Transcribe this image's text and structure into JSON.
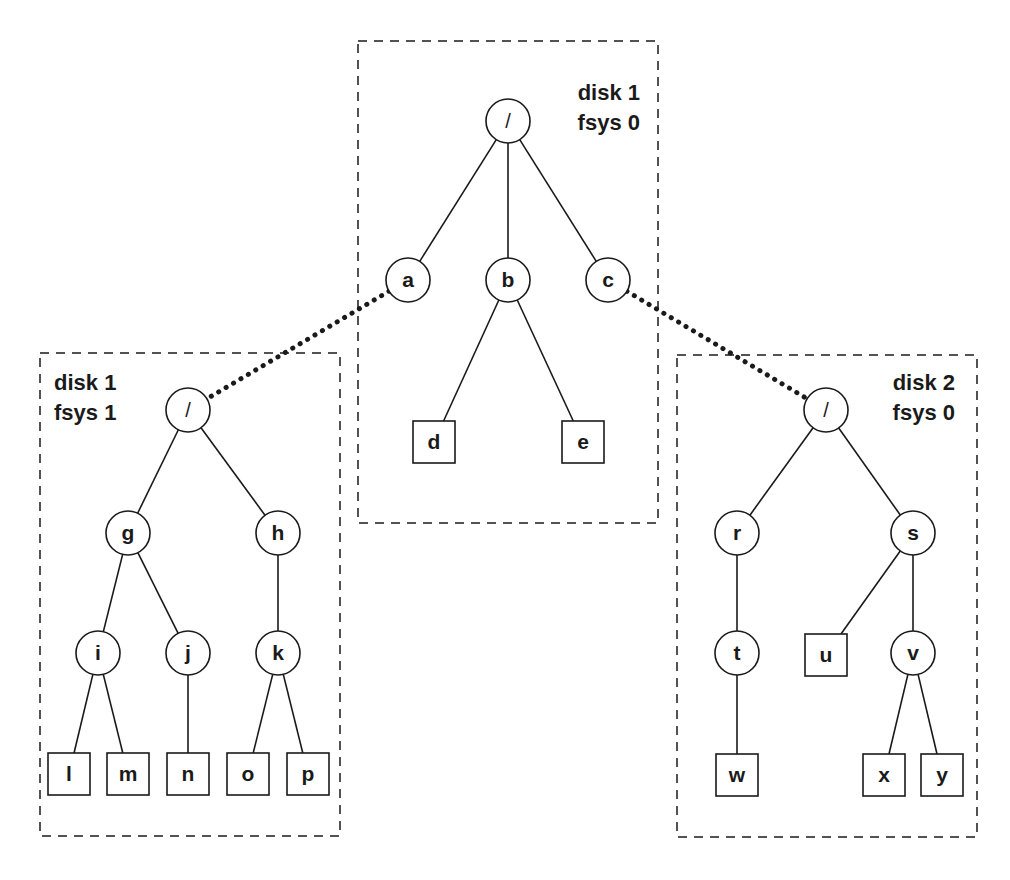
{
  "diagram": {
    "colors": {
      "stroke": "#1a1a1a",
      "background": "#ffffff"
    },
    "filesystems": [
      {
        "id": "center",
        "label_line1": "disk 1",
        "label_line2": "fsys 0",
        "box": {
          "x": 358,
          "y": 41,
          "w": 300,
          "h": 482
        },
        "label_x": 640,
        "label_y": 100,
        "anchor": "end"
      },
      {
        "id": "left",
        "label_line1": "disk 1",
        "label_line2": "fsys 1",
        "box": {
          "x": 40,
          "y": 353,
          "w": 300,
          "h": 483
        },
        "label_x": 54,
        "label_y": 390,
        "anchor": "start"
      },
      {
        "id": "right",
        "label_line1": "disk 2",
        "label_line2": "fsys 0",
        "box": {
          "x": 677,
          "y": 355,
          "w": 300,
          "h": 482
        },
        "label_x": 955,
        "label_y": 390,
        "anchor": "end"
      }
    ],
    "nodes": [
      {
        "id": "root0",
        "label": "/",
        "shape": "circle",
        "x": 508,
        "y": 121
      },
      {
        "id": "a",
        "label": "a",
        "shape": "circle",
        "x": 408,
        "y": 280
      },
      {
        "id": "b",
        "label": "b",
        "shape": "circle",
        "x": 508,
        "y": 280
      },
      {
        "id": "c",
        "label": "c",
        "shape": "circle",
        "x": 608,
        "y": 280
      },
      {
        "id": "d",
        "label": "d",
        "shape": "square",
        "x": 434,
        "y": 442
      },
      {
        "id": "e",
        "label": "e",
        "shape": "square",
        "x": 583,
        "y": 442
      },
      {
        "id": "root1",
        "label": "/",
        "shape": "circle",
        "x": 188,
        "y": 410
      },
      {
        "id": "g",
        "label": "g",
        "shape": "circle",
        "x": 128,
        "y": 533
      },
      {
        "id": "h",
        "label": "h",
        "shape": "circle",
        "x": 278,
        "y": 533
      },
      {
        "id": "i",
        "label": "i",
        "shape": "circle",
        "x": 98,
        "y": 653
      },
      {
        "id": "j",
        "label": "j",
        "shape": "circle",
        "x": 188,
        "y": 653
      },
      {
        "id": "k",
        "label": "k",
        "shape": "circle",
        "x": 278,
        "y": 653
      },
      {
        "id": "l",
        "label": "l",
        "shape": "square",
        "x": 69,
        "y": 774
      },
      {
        "id": "m",
        "label": "m",
        "shape": "square",
        "x": 128,
        "y": 774
      },
      {
        "id": "n",
        "label": "n",
        "shape": "square",
        "x": 188,
        "y": 774
      },
      {
        "id": "o",
        "label": "o",
        "shape": "square",
        "x": 248,
        "y": 774
      },
      {
        "id": "p",
        "label": "p",
        "shape": "square",
        "x": 308,
        "y": 774
      },
      {
        "id": "root2",
        "label": "/",
        "shape": "circle",
        "x": 826,
        "y": 410
      },
      {
        "id": "r",
        "label": "r",
        "shape": "circle",
        "x": 737,
        "y": 533
      },
      {
        "id": "s",
        "label": "s",
        "shape": "circle",
        "x": 913,
        "y": 533
      },
      {
        "id": "t",
        "label": "t",
        "shape": "circle",
        "x": 737,
        "y": 653
      },
      {
        "id": "u",
        "label": "u",
        "shape": "square",
        "x": 826,
        "y": 655
      },
      {
        "id": "v",
        "label": "v",
        "shape": "circle",
        "x": 913,
        "y": 653
      },
      {
        "id": "w",
        "label": "w",
        "shape": "square",
        "x": 737,
        "y": 775
      },
      {
        "id": "x",
        "label": "x",
        "shape": "square",
        "x": 884,
        "y": 775
      },
      {
        "id": "y",
        "label": "y",
        "shape": "square",
        "x": 942,
        "y": 775
      }
    ],
    "edges": [
      [
        "root0",
        "a"
      ],
      [
        "root0",
        "b"
      ],
      [
        "root0",
        "c"
      ],
      [
        "b",
        "d"
      ],
      [
        "b",
        "e"
      ],
      [
        "root1",
        "g"
      ],
      [
        "root1",
        "h"
      ],
      [
        "g",
        "i"
      ],
      [
        "g",
        "j"
      ],
      [
        "h",
        "k"
      ],
      [
        "i",
        "l"
      ],
      [
        "i",
        "m"
      ],
      [
        "j",
        "n"
      ],
      [
        "k",
        "o"
      ],
      [
        "k",
        "p"
      ],
      [
        "root2",
        "r"
      ],
      [
        "root2",
        "s"
      ],
      [
        "r",
        "t"
      ],
      [
        "s",
        "u"
      ],
      [
        "s",
        "v"
      ],
      [
        "t",
        "w"
      ],
      [
        "v",
        "x"
      ],
      [
        "v",
        "y"
      ]
    ],
    "mounts": [
      {
        "from": "a",
        "to": "root1",
        "label": "mount a -> disk1 fsys1"
      },
      {
        "from": "c",
        "to": "root2",
        "label": "mount c -> disk2 fsys0"
      }
    ]
  }
}
